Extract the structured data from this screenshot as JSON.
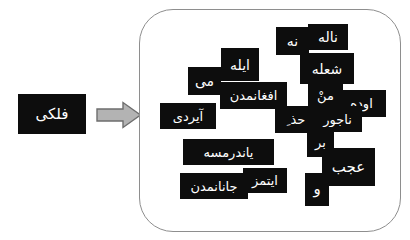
{
  "diagram": {
    "title": "",
    "direction": "left-to-right",
    "colors": {
      "tile_background": "#0d0d0d",
      "tile_text": "#ffffff",
      "panel_border": "#8e8e8e",
      "arrow_fill": "#b3b3b3",
      "arrow_stroke": "#6e6e6e",
      "page_background": "#ffffff"
    }
  },
  "source": {
    "label": "فلکی",
    "name": "source-word-box"
  },
  "arrow": {
    "icon": "right-arrow-icon",
    "label": ""
  },
  "target_panel": {
    "name": "target-word-cloud-panel",
    "tiles": [
      {
        "id": "nale",
        "text": "ناله"
      },
      {
        "id": "na",
        "text": "نه"
      },
      {
        "id": "ile",
        "text": "ایله"
      },
      {
        "id": "shole",
        "text": "شعله"
      },
      {
        "id": "mi",
        "text": "می"
      },
      {
        "id": "afgh",
        "text": "افغانمدن"
      },
      {
        "id": "man",
        "text": "منْ"
      },
      {
        "id": "oode",
        "text": "اوده"
      },
      {
        "id": "ayerdi",
        "text": "آیردی"
      },
      {
        "id": "haz",
        "text": "حذ ِ"
      },
      {
        "id": "najur",
        "text": "ناجور"
      },
      {
        "id": "bar",
        "text": "بر"
      },
      {
        "id": "yandr",
        "text": "یاندرمسه"
      },
      {
        "id": "ajab",
        "text": "عجب"
      },
      {
        "id": "va",
        "text": "و"
      },
      {
        "id": "itmaz",
        "text": "ایتمز"
      },
      {
        "id": "janan",
        "text": "جانانمدن"
      }
    ]
  }
}
